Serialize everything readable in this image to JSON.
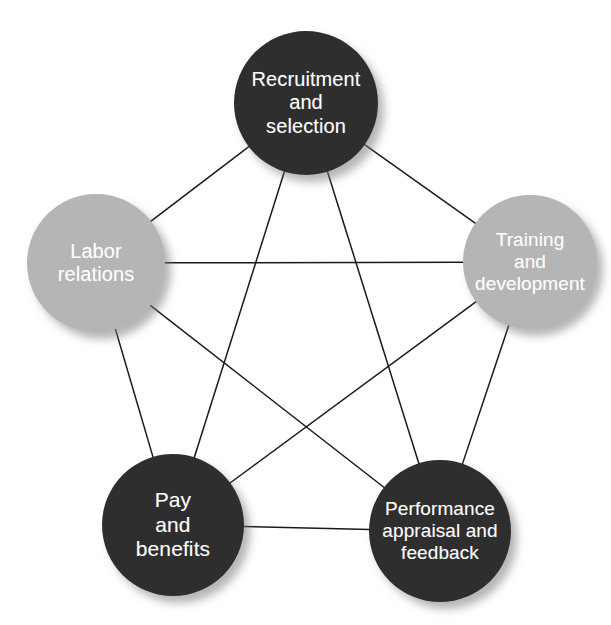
{
  "diagram": {
    "type": "pentagon-network",
    "background_color": "#ffffff",
    "dark_node_color": "#2e2e2e",
    "light_node_color": "#b5b5b5",
    "label_color": "#ffffff",
    "edge_color": "#1a1a1a",
    "nodes": [
      {
        "id": "recruitment-and-selection",
        "label": "Recruitment\nand\nselection",
        "line1": "Recruitment",
        "line2": "and",
        "line3": "selection",
        "shade": "dark",
        "color": "#2e2e2e",
        "cx": 306,
        "cy": 103,
        "r": 72,
        "font_size": 20
      },
      {
        "id": "training-and-development",
        "label": "Training\nand\ndevelopment",
        "line1": "Training",
        "line2": "and",
        "line3": "development",
        "shade": "light",
        "color": "#b5b5b5",
        "cx": 530,
        "cy": 262,
        "r": 67,
        "font_size": 19
      },
      {
        "id": "performance-appraisal-and-feedback",
        "label": "Performance\nappraisal and\nfeedback",
        "line1": "Performance",
        "line2": "appraisal and",
        "line3": "feedback",
        "shade": "dark",
        "color": "#2e2e2e",
        "cx": 440,
        "cy": 531,
        "r": 71,
        "font_size": 19
      },
      {
        "id": "pay-and-benefits",
        "label": "Pay\nand\nbenefits",
        "line1": "Pay",
        "line2": "and",
        "line3": "benefits",
        "shade": "dark",
        "color": "#2e2e2e",
        "cx": 173,
        "cy": 525,
        "r": 71,
        "font_size": 21
      },
      {
        "id": "labor-relations",
        "label": "Labor\nrelations",
        "line1": "Labor",
        "line2": "relations",
        "line3": "",
        "shade": "light",
        "color": "#b5b5b5",
        "cx": 96,
        "cy": 263,
        "r": 69,
        "font_size": 20
      }
    ],
    "edges": [
      {
        "from": "recruitment-and-selection",
        "to": "training-and-development",
        "kind": "perimeter"
      },
      {
        "from": "training-and-development",
        "to": "performance-appraisal-and-feedback",
        "kind": "perimeter"
      },
      {
        "from": "performance-appraisal-and-feedback",
        "to": "pay-and-benefits",
        "kind": "perimeter"
      },
      {
        "from": "pay-and-benefits",
        "to": "labor-relations",
        "kind": "perimeter"
      },
      {
        "from": "labor-relations",
        "to": "recruitment-and-selection",
        "kind": "perimeter"
      },
      {
        "from": "recruitment-and-selection",
        "to": "performance-appraisal-and-feedback",
        "kind": "diagonal"
      },
      {
        "from": "recruitment-and-selection",
        "to": "pay-and-benefits",
        "kind": "diagonal"
      },
      {
        "from": "training-and-development",
        "to": "pay-and-benefits",
        "kind": "diagonal"
      },
      {
        "from": "training-and-development",
        "to": "labor-relations",
        "kind": "diagonal"
      },
      {
        "from": "performance-appraisal-and-feedback",
        "to": "labor-relations",
        "kind": "diagonal"
      }
    ]
  }
}
